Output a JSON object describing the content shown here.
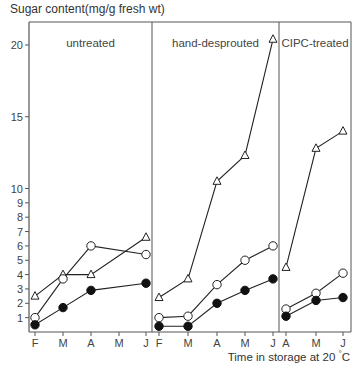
{
  "chart_data": {
    "type": "line",
    "ylabel": "Sugar content (mg/g fresh wt)",
    "xlabel": "Time in storage at 20 °C",
    "ylim": [
      0,
      21
    ],
    "yticks": [
      1,
      2,
      3,
      4,
      5,
      6,
      7,
      8,
      9,
      10,
      15,
      20
    ],
    "grid": false,
    "legend": "none (markers: open triangle, open circle, filled circle)",
    "panels": [
      {
        "title": "untreated",
        "categories": [
          "F",
          "M",
          "A",
          "M",
          "J"
        ],
        "series": [
          {
            "marker": "open-triangle",
            "x": [
              "F",
              "M",
              "A",
              "J"
            ],
            "values": [
              2.5,
              4.0,
              4.0,
              6.6
            ]
          },
          {
            "marker": "open-circle",
            "x": [
              "F",
              "M",
              "A",
              "J"
            ],
            "values": [
              1.0,
              3.7,
              6.0,
              5.4
            ]
          },
          {
            "marker": "filled-circle",
            "x": [
              "F",
              "M",
              "A",
              "J"
            ],
            "values": [
              0.5,
              1.7,
              2.9,
              3.4
            ]
          }
        ]
      },
      {
        "title": "hand-desprouted",
        "categories": [
          "F",
          "M",
          "A",
          "M",
          "J"
        ],
        "series": [
          {
            "marker": "open-triangle",
            "x": [
              "F",
              "M",
              "A",
              "M",
              "J"
            ],
            "values": [
              2.4,
              3.7,
              10.5,
              12.3,
              20.4
            ]
          },
          {
            "marker": "open-circle",
            "x": [
              "F",
              "M",
              "A",
              "M",
              "J"
            ],
            "values": [
              1.0,
              1.1,
              3.3,
              5.0,
              6.0
            ]
          },
          {
            "marker": "filled-circle",
            "x": [
              "F",
              "M",
              "A",
              "M",
              "J"
            ],
            "values": [
              0.4,
              0.4,
              2.0,
              2.9,
              3.7
            ]
          }
        ]
      },
      {
        "title": "CIPC-treated",
        "categories": [
          "A",
          "M",
          "J"
        ],
        "series": [
          {
            "marker": "open-triangle",
            "x": [
              "A",
              "M",
              "J"
            ],
            "values": [
              4.5,
              12.8,
              14.0
            ]
          },
          {
            "marker": "open-circle",
            "x": [
              "A",
              "M",
              "J"
            ],
            "values": [
              1.6,
              2.7,
              4.1
            ]
          },
          {
            "marker": "filled-circle",
            "x": [
              "A",
              "M",
              "J"
            ],
            "values": [
              1.1,
              2.2,
              2.4
            ]
          }
        ]
      }
    ]
  },
  "labels": {
    "ylabel": "Sugar content(mg/g fresh wt)",
    "xlabel": "Time in storage at 20 ",
    "xlabel_unit": "°",
    "xlabel_end": "C"
  }
}
